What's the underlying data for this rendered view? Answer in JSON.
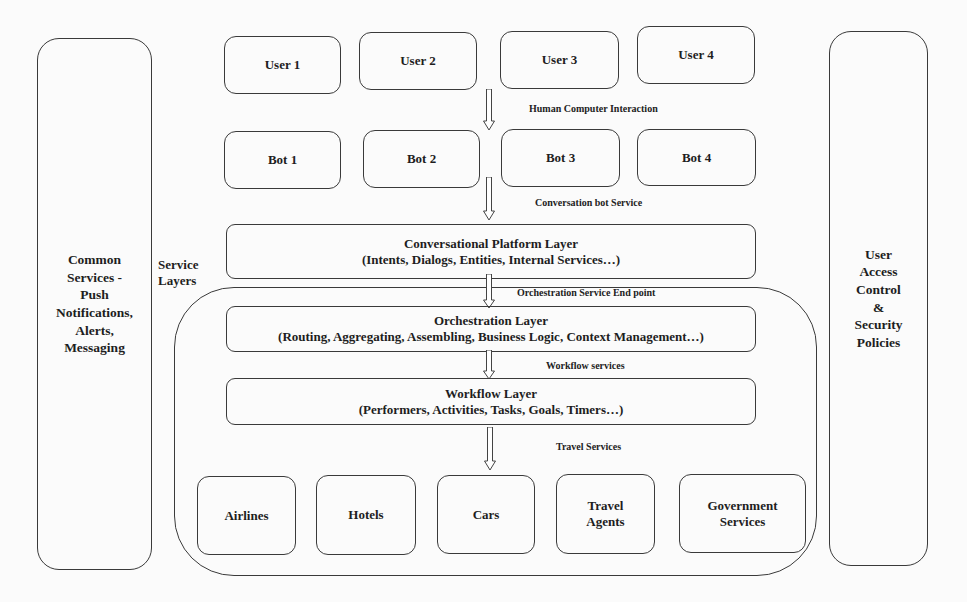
{
  "left_panel": {
    "lines": [
      "Common",
      "Services -",
      "Push",
      "Notifications,",
      "Alerts,",
      "Messaging"
    ]
  },
  "right_panel": {
    "lines": [
      "User",
      "Access",
      "Control",
      "&",
      "Security",
      "Policies"
    ]
  },
  "users": [
    "User 1",
    "User 2",
    "User 3",
    "User 4"
  ],
  "bots": [
    "Bot 1",
    "Bot 2",
    "Bot 3",
    "Bot 4"
  ],
  "service_layers_label": {
    "lines": [
      "Service",
      "Layers"
    ]
  },
  "connectors": {
    "hci": "Human  Computer  Interaction",
    "bot_service": "Conversation bot  Service",
    "orchestration_endpoint": "Orchestration  Service End  point",
    "workflow_services": "Workflow  services",
    "travel_services": "Travel Services"
  },
  "layers": {
    "conversational": {
      "title": "Conversational Platform Layer",
      "subtitle": "(Intents, Dialogs, Entities, Internal Services…)"
    },
    "orchestration": {
      "title": "Orchestration Layer",
      "subtitle": "(Routing, Aggregating, Assembling, Business Logic, Context Management…)"
    },
    "workflow": {
      "title": "Workflow Layer",
      "subtitle": "(Performers, Activities, Tasks, Goals, Timers…)"
    }
  },
  "services": [
    {
      "lines": [
        "Airlines"
      ]
    },
    {
      "lines": [
        "Hotels"
      ]
    },
    {
      "lines": [
        "Cars"
      ]
    },
    {
      "lines": [
        "Travel",
        "Agents"
      ]
    },
    {
      "lines": [
        "Government",
        "Services"
      ]
    }
  ],
  "colors": {
    "stroke": "#3a3a3a",
    "background": "#fbfbfb",
    "text": "#1e1e1e"
  }
}
